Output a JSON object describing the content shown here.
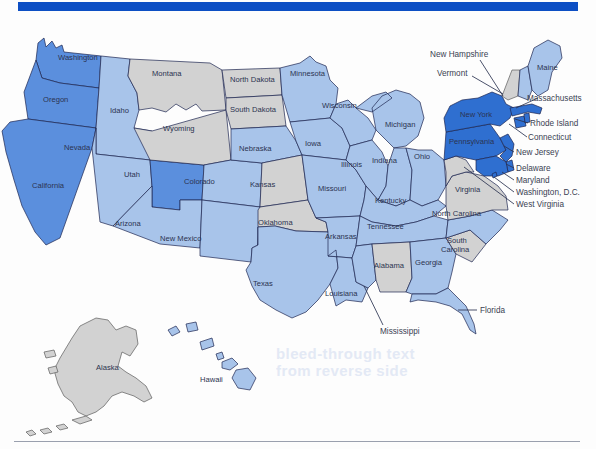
{
  "figure": {
    "type": "choropleth-map",
    "region": "United States",
    "top_rule_color": "#0d4fc4",
    "bottom_rule_color": "#9aa0ae",
    "background_color": "#ffffff",
    "ghost_text": "faint bleed-through text from reverse of page"
  },
  "legend_colors": {
    "dark_blue": "#2f6fd0",
    "medium_blue": "#5b8fdd",
    "light_blue": "#a8c4ea",
    "pale_blue": "#c2d6f0",
    "gray": "#d2d2d2",
    "border": "#1d2550"
  },
  "map_data": {
    "type": "choropleth",
    "value_key": "shade",
    "states": [
      {
        "code": "WA",
        "name": "Washington",
        "shade": "medium_blue",
        "label_placement": "inside"
      },
      {
        "code": "OR",
        "name": "Oregon",
        "shade": "medium_blue",
        "label_placement": "inside"
      },
      {
        "code": "CA",
        "name": "California",
        "shade": "medium_blue",
        "label_placement": "inside"
      },
      {
        "code": "ID",
        "name": "Idaho",
        "shade": "light_blue",
        "label_placement": "inside"
      },
      {
        "code": "NV",
        "name": "Nevada",
        "shade": "light_blue",
        "label_placement": "inside"
      },
      {
        "code": "UT",
        "name": "Utah",
        "shade": "medium_blue",
        "label_placement": "inside"
      },
      {
        "code": "AZ",
        "name": "Arizona",
        "shade": "light_blue",
        "label_placement": "inside"
      },
      {
        "code": "MT",
        "name": "Montana",
        "shade": "gray",
        "label_placement": "inside"
      },
      {
        "code": "WY",
        "name": "Wyoming",
        "shade": "gray",
        "label_placement": "inside"
      },
      {
        "code": "CO",
        "name": "Colorado",
        "shade": "light_blue",
        "label_placement": "inside"
      },
      {
        "code": "NM",
        "name": "New Mexico",
        "shade": "light_blue",
        "label_placement": "inside"
      },
      {
        "code": "ND",
        "name": "North Dakota",
        "shade": "gray",
        "label_placement": "inside"
      },
      {
        "code": "SD",
        "name": "South Dakota",
        "shade": "gray",
        "label_placement": "inside"
      },
      {
        "code": "NE",
        "name": "Nebraska",
        "shade": "light_blue",
        "label_placement": "inside"
      },
      {
        "code": "KS",
        "name": "Kansas",
        "shade": "gray",
        "label_placement": "inside"
      },
      {
        "code": "OK",
        "name": "Oklahoma",
        "shade": "gray",
        "label_placement": "inside"
      },
      {
        "code": "TX",
        "name": "Texas",
        "shade": "light_blue",
        "label_placement": "inside"
      },
      {
        "code": "MN",
        "name": "Minnesota",
        "shade": "light_blue",
        "label_placement": "inside"
      },
      {
        "code": "IA",
        "name": "Iowa",
        "shade": "light_blue",
        "label_placement": "inside"
      },
      {
        "code": "MO",
        "name": "Missouri",
        "shade": "light_blue",
        "label_placement": "inside"
      },
      {
        "code": "AR",
        "name": "Arkansas",
        "shade": "light_blue",
        "label_placement": "inside"
      },
      {
        "code": "LA",
        "name": "Louisiana",
        "shade": "light_blue",
        "label_placement": "inside"
      },
      {
        "code": "WI",
        "name": "Wisconsin",
        "shade": "light_blue",
        "label_placement": "inside"
      },
      {
        "code": "IL",
        "name": "Illinois",
        "shade": "light_blue",
        "label_placement": "inside"
      },
      {
        "code": "MI",
        "name": "Michigan",
        "shade": "light_blue",
        "label_placement": "inside"
      },
      {
        "code": "IN",
        "name": "Indiana",
        "shade": "light_blue",
        "label_placement": "inside"
      },
      {
        "code": "OH",
        "name": "Ohio",
        "shade": "light_blue",
        "label_placement": "inside"
      },
      {
        "code": "KY",
        "name": "Kentucky",
        "shade": "light_blue",
        "label_placement": "inside"
      },
      {
        "code": "TN",
        "name": "Tennessee",
        "shade": "light_blue",
        "label_placement": "inside"
      },
      {
        "code": "MS",
        "name": "Mississippi",
        "shade": "light_blue",
        "label_placement": "leader"
      },
      {
        "code": "AL",
        "name": "Alabama",
        "shade": "gray",
        "label_placement": "inside"
      },
      {
        "code": "GA",
        "name": "Georgia",
        "shade": "light_blue",
        "label_placement": "inside"
      },
      {
        "code": "FL",
        "name": "Florida",
        "shade": "light_blue",
        "label_placement": "leader"
      },
      {
        "code": "SC",
        "name": "South Carolina",
        "shade": "gray",
        "label_placement": "inside"
      },
      {
        "code": "NC",
        "name": "North Carolina",
        "shade": "light_blue",
        "label_placement": "inside"
      },
      {
        "code": "VA",
        "name": "Virginia",
        "shade": "gray",
        "label_placement": "inside"
      },
      {
        "code": "WV",
        "name": "West Virginia",
        "shade": "gray",
        "label_placement": "leader"
      },
      {
        "code": "MD",
        "name": "Maryland",
        "shade": "dark_blue",
        "label_placement": "leader"
      },
      {
        "code": "DE",
        "name": "Delaware",
        "shade": "dark_blue",
        "label_placement": "leader"
      },
      {
        "code": "DC",
        "name": "Washington, D.C.",
        "shade": "dark_blue",
        "label_placement": "leader"
      },
      {
        "code": "PA",
        "name": "Pennsylvania",
        "shade": "dark_blue",
        "label_placement": "inside"
      },
      {
        "code": "NJ",
        "name": "New Jersey",
        "shade": "dark_blue",
        "label_placement": "leader"
      },
      {
        "code": "NY",
        "name": "New York",
        "shade": "dark_blue",
        "label_placement": "inside"
      },
      {
        "code": "CT",
        "name": "Connecticut",
        "shade": "dark_blue",
        "label_placement": "leader"
      },
      {
        "code": "RI",
        "name": "Rhode Island",
        "shade": "dark_blue",
        "label_placement": "leader"
      },
      {
        "code": "MA",
        "name": "Massachusetts",
        "shade": "dark_blue",
        "label_placement": "leader"
      },
      {
        "code": "VT",
        "name": "Vermont",
        "shade": "gray",
        "label_placement": "leader"
      },
      {
        "code": "NH",
        "name": "New Hampshire",
        "shade": "light_blue",
        "label_placement": "leader"
      },
      {
        "code": "ME",
        "name": "Maine",
        "shade": "light_blue",
        "label_placement": "inside"
      },
      {
        "code": "AK",
        "name": "Alaska",
        "shade": "gray",
        "label_placement": "inside"
      },
      {
        "code": "HI",
        "name": "Hawaii",
        "shade": "light_blue",
        "label_placement": "inside"
      }
    ]
  },
  "labels": {
    "WA": "Washington",
    "OR": "Oregon",
    "CA": "California",
    "ID": "Idaho",
    "NV": "Nevada",
    "UT": "Utah",
    "AZ": "Arizona",
    "MT": "Montana",
    "WY": "Wyoming",
    "CO": "Colorado",
    "NM": "New Mexico",
    "ND": "North Dakota",
    "SD": "South Dakota",
    "NE": "Nebraska",
    "KS": "Kansas",
    "OK": "Oklahoma",
    "TX": "Texas",
    "MN": "Minnesota",
    "IA": "Iowa",
    "MO": "Missouri",
    "AR": "Arkansas",
    "LA": "Louisiana",
    "WI": "Wisconsin",
    "IL": "Illinois",
    "MI": "Michigan",
    "IN": "Indiana",
    "OH": "Ohio",
    "KY": "Kentucky",
    "TN": "Tennessee",
    "MS": "Mississippi",
    "AL": "Alabama",
    "GA": "Georgia",
    "FL": "Florida",
    "SC1": "South",
    "SC2": "Carolina",
    "NC": "North Carolina",
    "VA": "Virginia",
    "WV": "West Virginia",
    "MD": "Maryland",
    "DE": "Delaware",
    "DC": "Washington, D.C.",
    "PA": "Pennsylvania",
    "NJ": "New Jersey",
    "NY": "New York",
    "CT": "Connecticut",
    "RI": "Rhode Island",
    "MA": "Massachusetts",
    "VT": "Vermont",
    "NH": "New Hampshire",
    "ME": "Maine",
    "AK": "Alaska",
    "HI": "Hawaii"
  },
  "ghost": "bleed-through text\nfrom reverse side"
}
